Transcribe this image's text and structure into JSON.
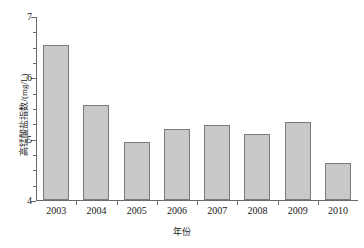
{
  "chart_data": {
    "type": "bar",
    "title": "",
    "xlabel": "年份",
    "ylabel": "高锰酸盐指数/(mg/L)",
    "categories": [
      "2003",
      "2004",
      "2005",
      "2006",
      "2007",
      "2008",
      "2009",
      "2010"
    ],
    "values": [
      6.52,
      5.55,
      4.94,
      5.16,
      5.22,
      5.08,
      5.28,
      4.6
    ],
    "ylim": [
      4,
      7
    ],
    "y_ticks_major": [
      4,
      5,
      6,
      7
    ],
    "y_tick_labels": [
      "4",
      "5",
      "6",
      "7"
    ],
    "y_ticks_minor": [
      4.25,
      4.5,
      4.75,
      5.25,
      5.5,
      5.75,
      6.25,
      6.5,
      6.75
    ],
    "grid": false,
    "legend": false,
    "bar_fill_color": "#c9c9c9",
    "bar_border_color": "#7a7a7a",
    "axis_color": "#6b6b6b",
    "background_color": "#ffffff"
  },
  "axes": {
    "y_title": "高锰酸盐指数/(mg/L)",
    "x_title": "年份"
  }
}
